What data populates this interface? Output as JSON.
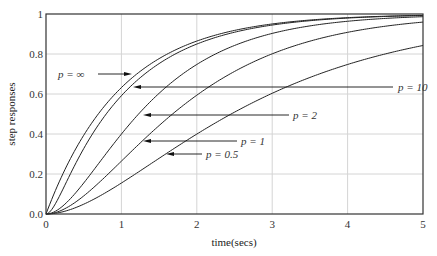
{
  "chart_data": {
    "type": "line",
    "title": "",
    "xlabel": "time(secs)",
    "ylabel": "step responses",
    "xlim": [
      0,
      5
    ],
    "ylim": [
      0,
      1
    ],
    "grid": true,
    "legend": "none (curves labelled with arrow annotations)",
    "x_ticks": [
      "0",
      "1",
      "2",
      "3",
      "4",
      "5"
    ],
    "y_ticks": [
      "0.0",
      "0.2",
      "0.4",
      "0.6",
      "0.8",
      "1"
    ],
    "x": [
      0,
      0.25,
      0.5,
      0.75,
      1,
      1.25,
      1.5,
      1.75,
      2,
      2.5,
      3,
      3.5,
      4,
      4.5,
      5
    ],
    "series": [
      {
        "name": "p = ∞",
        "values": [
          0,
          0.221,
          0.393,
          0.528,
          0.632,
          0.713,
          0.777,
          0.826,
          0.865,
          0.918,
          0.95,
          0.97,
          0.982,
          0.989,
          0.993
        ]
      },
      {
        "name": "p = 10",
        "values": [
          0,
          0.144,
          0.325,
          0.47,
          0.591,
          0.683,
          0.752,
          0.807,
          0.85,
          0.909,
          0.945,
          0.967,
          0.98,
          0.988,
          0.993
        ]
      },
      {
        "name": "p = 2",
        "values": [
          0,
          0.045,
          0.155,
          0.283,
          0.4,
          0.5,
          0.582,
          0.65,
          0.748,
          0.84,
          0.902,
          0.94,
          0.964,
          0.978,
          0.987
        ]
      },
      {
        "name": "p = 1",
        "values": [
          0,
          0.026,
          0.09,
          0.173,
          0.264,
          0.355,
          0.442,
          0.522,
          0.594,
          0.713,
          0.801,
          0.864,
          0.908,
          0.939,
          0.96
        ]
      },
      {
        "name": "p = 0.5",
        "values": [
          0,
          0.014,
          0.048,
          0.097,
          0.155,
          0.22,
          0.286,
          0.352,
          0.416,
          0.533,
          0.634,
          0.716,
          0.783,
          0.835,
          0.843
        ]
      }
    ],
    "annotations": [
      {
        "text": "p = ∞",
        "label_x_px": 58,
        "y_px": 74,
        "line_from_px": 98,
        "tip_px": 132
      },
      {
        "text": "p = 10",
        "label_x_px": 398,
        "y_px": 87,
        "line_from_px": 393,
        "tip_px": 133
      },
      {
        "text": "p = 2",
        "label_x_px": 293,
        "y_px": 115,
        "line_from_px": 289,
        "tip_px": 143
      },
      {
        "text": "p = 1",
        "label_x_px": 241,
        "y_px": 141,
        "line_from_px": 237,
        "tip_px": 143
      },
      {
        "text": "p = 0.5",
        "label_x_px": 206,
        "y_px": 154,
        "line_from_px": 202,
        "tip_px": 166
      }
    ],
    "highlight_colors": {
      "p = 10 tail": "#3cb44b",
      "p = ∞ tail": "#d05a5a"
    }
  },
  "layout": {
    "plot_left": 46,
    "plot_top": 14,
    "plot_right": 423,
    "plot_bottom": 214
  }
}
